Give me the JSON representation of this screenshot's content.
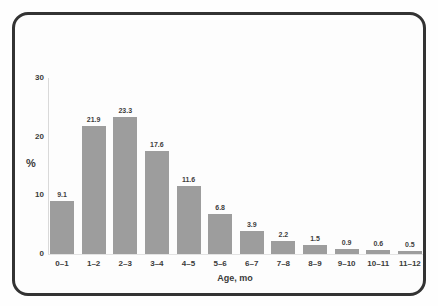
{
  "chart_data": {
    "type": "bar",
    "categories": [
      "0–1",
      "1–2",
      "2–3",
      "3–4",
      "4–5",
      "5–6",
      "6–7",
      "7–8",
      "8–9",
      "9–10",
      "10–11",
      "11–12"
    ],
    "values": [
      9.1,
      21.9,
      23.3,
      17.6,
      11.6,
      6.8,
      3.9,
      2.2,
      1.5,
      0.9,
      0.6,
      0.5
    ],
    "value_labels": [
      "9.1",
      "21.9",
      "23.3",
      "17.6",
      "11.6",
      "6.8",
      "3.9",
      "2.2",
      "1.5",
      "0.9",
      "0.6",
      "0.5"
    ],
    "title": "",
    "xlabel": "Age, mo",
    "ylabel": "%",
    "ylim": [
      0,
      30
    ],
    "yticks": [
      0,
      10,
      20,
      30
    ],
    "grid": false,
    "legend": false,
    "bar_color": "#9d9d9d",
    "frame_border_color": "#333333"
  }
}
